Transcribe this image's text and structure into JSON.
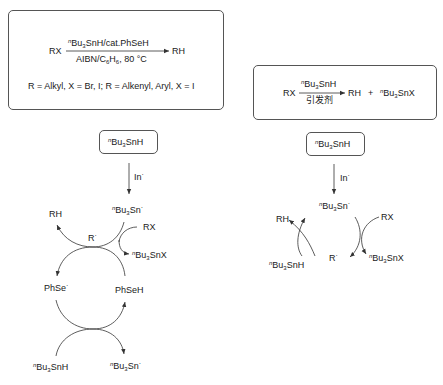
{
  "scheme_left": {
    "box": {
      "reactant": "RX",
      "reagent_above": "Bu3SnH/cat.PhSeH",
      "reagent_above_prefix": "n",
      "conditions_below": "AIBN/C6H6, 80 °C",
      "product": "RH",
      "scope": "R = Alkyl, X = Br, I; R = Alkenyl, Aryl, X = I"
    },
    "start_reagent": "nBu3SnH",
    "initiator_label": "In·",
    "cycle": {
      "tin_radical_top": "nBu3Sn·",
      "rh": "RH",
      "rx": "RX",
      "alkyl_radical": "R·",
      "tin_halide": "nBu3SnX",
      "phse_radical": "PhSe·",
      "phseh": "PhSeH",
      "tin_hydride_bottom": "nBu3SnH",
      "tin_radical_bottom": "nBu3Sn·"
    }
  },
  "scheme_right": {
    "box": {
      "reactant": "RX",
      "reagent_above": "nBu3SnH",
      "conditions_below": "引发剂",
      "product_1": "RH",
      "plus": "+",
      "product_2": "nBu3SnX"
    },
    "start_reagent": "nBu3SnH",
    "initiator_label": "In·",
    "cycle": {
      "tin_radical_top": "nBu3Sn·",
      "rh": "RH",
      "rx": "RX",
      "alkyl_radical": "R·",
      "tin_hydride": "nBu3SnH",
      "tin_halide": "nBu3SnX"
    }
  },
  "text_pieces": {
    "n": "n",
    "Bu": "Bu",
    "sub3": "3",
    "SnH": "SnH",
    "SnX": "SnX",
    "Sn": "Sn",
    "dot": "·",
    "cat_PhSeH": "SnH/cat.PhSeH",
    "AIBN_C": "AIBN/C",
    "sub6": "6",
    "H": "H",
    "temp": ", 80 °C",
    "RX": "RX",
    "RH": "RH",
    "R": "R",
    "In": "In",
    "PhSe": "PhSe",
    "PhSeH": "PhSeH",
    "plus": "+",
    "initiator_cn": "引发剂",
    "scope": "R = Alkyl, X = Br, I; R = Alkenyl, Aryl, X = I"
  }
}
